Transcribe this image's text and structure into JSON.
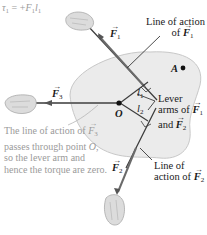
{
  "figure": {
    "equation": "τ₁ = +F₁l₁",
    "equation_parts": {
      "tau": "τ",
      "tau_sub": "1",
      "equals": " = +",
      "F": "F",
      "F_sub": "1",
      "l": "l",
      "l_sub": "1"
    },
    "labels": {
      "F1": {
        "symbol": "F",
        "sub": "1"
      },
      "F2": {
        "symbol": "F",
        "sub": "2"
      },
      "F3": {
        "symbol": "F",
        "sub": "3"
      },
      "point_A": "A",
      "point_O": "O",
      "l1": {
        "symbol": "l",
        "sub": "1"
      },
      "l2": {
        "symbol": "l",
        "sub": "2"
      }
    },
    "annotations": {
      "line_of_action_F1": {
        "line1": "Line of action",
        "line2_prefix": "of ",
        "symbol": "F",
        "sub": "1"
      },
      "lever_arms": {
        "line1": "Lever",
        "line2_prefix": "arms of ",
        "line2_symbol": "F",
        "line2_sub": "1",
        "line3_prefix": "and ",
        "line3_symbol": "F",
        "line3_sub": "2"
      },
      "line_of_action_F2": {
        "line1": "Line of",
        "line2_prefix": "action of ",
        "symbol": "F",
        "sub": "2"
      },
      "F3_note": {
        "line1_prefix": "The line of action of ",
        "line1_symbol": "F",
        "line1_sub": "3",
        "line2_prefix": "passes through point ",
        "line2_point": "O",
        "line2_suffix": ",",
        "line3": "so the lever arm and",
        "line4": "hence the torque are zero."
      }
    },
    "colors": {
      "body_fill": "#ebebeb",
      "body_stroke": "#c8c8c8",
      "force_arrow": "#555555",
      "line_of_action": "#3a3a3a",
      "text": "#1a1a1a",
      "grey_text": "#9a9a9a",
      "hand": "#d8d8d8"
    }
  }
}
